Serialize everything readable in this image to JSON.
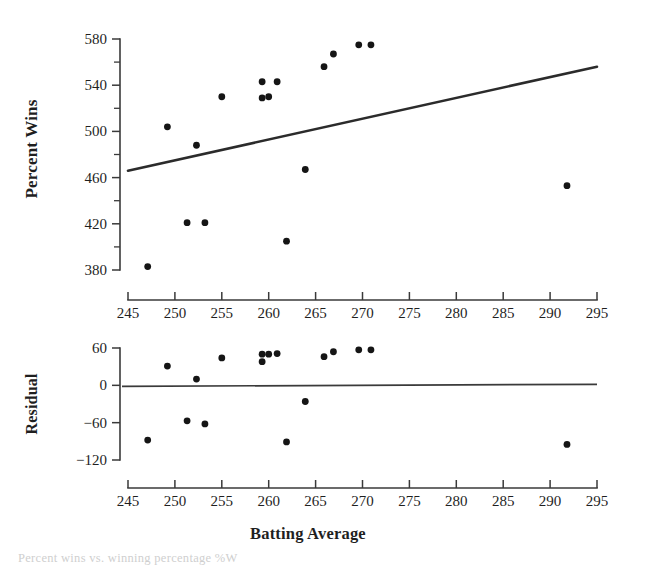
{
  "figure": {
    "xlabel": "Batting Average",
    "caption_fragment": "Percent wins vs. winning percentage      %W"
  },
  "panels": {
    "top": {
      "ylabel": "Percent Wins",
      "y_ticks": [
        "380",
        "420",
        "460",
        "500",
        "540",
        "580"
      ],
      "x_ticks": [
        "245",
        "250",
        "255",
        "260",
        "265",
        "270",
        "275",
        "280",
        "285",
        "290",
        "295"
      ]
    },
    "bottom": {
      "ylabel": "Residual",
      "y_ticks": [
        "-120",
        "-60",
        "0",
        "60"
      ],
      "x_ticks": [
        "245",
        "250",
        "255",
        "260",
        "265",
        "270",
        "275",
        "280",
        "285",
        "290",
        "295"
      ]
    }
  },
  "chart_data": [
    {
      "type": "scatter",
      "title": "",
      "xlabel": "Batting Average",
      "ylabel": "Percent Wins",
      "xlim": [
        245,
        295
      ],
      "ylim": [
        370,
        588
      ],
      "x_ticks": [
        245,
        250,
        255,
        260,
        265,
        270,
        275,
        280,
        285,
        290,
        295
      ],
      "y_ticks": [
        380,
        420,
        460,
        500,
        540,
        580
      ],
      "grid": false,
      "legend": "none",
      "points": [
        {
          "x": 247.1,
          "y": 383
        },
        {
          "x": 249.2,
          "y": 504
        },
        {
          "x": 251.3,
          "y": 421
        },
        {
          "x": 252.3,
          "y": 488
        },
        {
          "x": 253.2,
          "y": 421
        },
        {
          "x": 255.0,
          "y": 530
        },
        {
          "x": 259.3,
          "y": 543
        },
        {
          "x": 259.3,
          "y": 529
        },
        {
          "x": 260.0,
          "y": 530
        },
        {
          "x": 260.9,
          "y": 543
        },
        {
          "x": 261.9,
          "y": 405
        },
        {
          "x": 263.9,
          "y": 467
        },
        {
          "x": 265.9,
          "y": 556
        },
        {
          "x": 266.9,
          "y": 567
        },
        {
          "x": 269.6,
          "y": 575
        },
        {
          "x": 270.9,
          "y": 575
        },
        {
          "x": 291.8,
          "y": 453
        }
      ],
      "fit_line": {
        "x0": 245,
        "y0": 466,
        "x1": 295,
        "y1": 556
      }
    },
    {
      "type": "scatter",
      "title": "",
      "xlabel": "Batting Average",
      "ylabel": "Residual",
      "xlim": [
        245,
        295
      ],
      "ylim": [
        -135,
        75
      ],
      "x_ticks": [
        245,
        250,
        255,
        260,
        265,
        270,
        275,
        280,
        285,
        290,
        295
      ],
      "y_ticks": [
        -120,
        -60,
        0,
        60
      ],
      "grid": false,
      "legend": "none",
      "reference_line": {
        "y": 0
      },
      "points": [
        {
          "x": 247.1,
          "y": -88
        },
        {
          "x": 249.2,
          "y": 31
        },
        {
          "x": 251.3,
          "y": -57
        },
        {
          "x": 252.3,
          "y": 10
        },
        {
          "x": 253.2,
          "y": -62
        },
        {
          "x": 255.0,
          "y": 44
        },
        {
          "x": 259.3,
          "y": 50
        },
        {
          "x": 259.3,
          "y": 38
        },
        {
          "x": 260.0,
          "y": 50
        },
        {
          "x": 260.9,
          "y": 51
        },
        {
          "x": 261.9,
          "y": -91
        },
        {
          "x": 263.9,
          "y": -26
        },
        {
          "x": 265.9,
          "y": 46
        },
        {
          "x": 266.9,
          "y": 54
        },
        {
          "x": 269.6,
          "y": 57
        },
        {
          "x": 270.9,
          "y": 57
        },
        {
          "x": 291.8,
          "y": -95
        }
      ]
    }
  ]
}
